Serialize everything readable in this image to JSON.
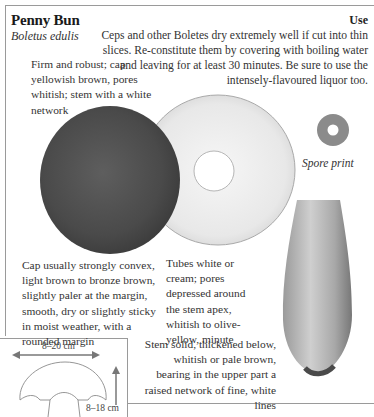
{
  "header": {
    "common_name": "Penny Bun",
    "latin_name": "Boletus edulis"
  },
  "use": {
    "heading": "Use",
    "text": "Ceps and other Boletes dry extremely well if cut into thin slices. Re-constitute them by covering with boiling water and leaving for at least 30 minutes. Be sure to use the intensely-flavoured liquor too."
  },
  "descriptions": {
    "general": "Firm and robust; cap yellowish brown, pores whitish; stem with a white network",
    "cap": "Cap usually strongly convex, light brown to bronze brown, slightly paler at the margin, smooth, dry or slightly sticky in moist weather, with a rounded margin",
    "tubes": "Tubes white or cream; pores depressed around the stem apex, whitish to olive-yellow, minute",
    "stem": "Stem solid, thickened below, whitish or pale brown, bearing in the upper part a raised network of fine, white lines"
  },
  "illustrations": {
    "spore_print_label": "Spore print",
    "cap_top": "cap-top-view",
    "cap_underside": "cap-underside-pores",
    "stem": "stem-illustration"
  },
  "size_diagram": {
    "width_label": "8–20 cm",
    "height_label": "8–18 cm"
  }
}
